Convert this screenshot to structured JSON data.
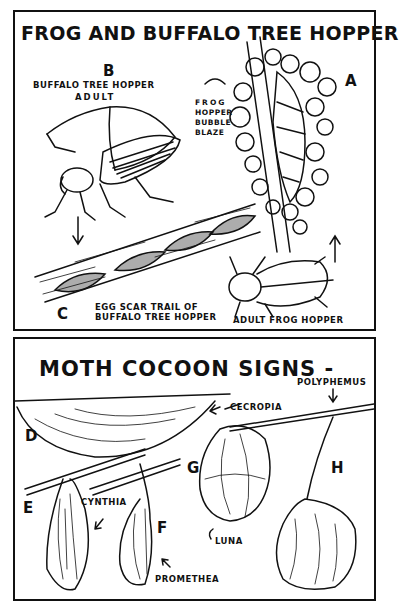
{
  "top_panel": {
    "title": "FROG AND BUFFALO TREE HOPPER",
    "labels": {
      "a": "A",
      "b": "B",
      "c": "C",
      "buffalo_adult_line1": "BUFFALO TREE HOPPER",
      "buffalo_adult_line2": "ADULT",
      "bubble_line1": "FROG",
      "bubble_line2": "HOPPER",
      "bubble_line3": "BUBBLE",
      "bubble_line4": "BLAZE",
      "egg_scar_line1": "EGG SCAR TRAIL OF",
      "egg_scar_line2": "BUFFALO TREE HOPPER",
      "adult_frog": "ADULT FROG HOPPER"
    }
  },
  "bottom_panel": {
    "title": "MOTH COCOON SIGNS -",
    "labels": {
      "d": "D",
      "e": "E",
      "f": "F",
      "g": "G",
      "h": "H",
      "cecropia": "CECROPIA",
      "polyphemus": "POLYPHEMUS",
      "cynthia": "CYNTHIA",
      "promethea": "PROMETHEA",
      "luna": "LUNA"
    }
  },
  "colors": {
    "ink": "#111111",
    "paper": "#ffffff"
  }
}
